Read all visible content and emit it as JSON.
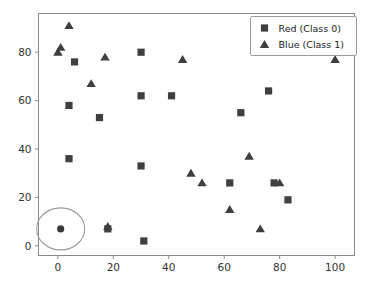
{
  "chart_data": {
    "type": "scatter",
    "title": "",
    "xlabel": "",
    "ylabel": "",
    "xlim": [
      -7,
      107
    ],
    "ylim": [
      -4,
      96
    ],
    "xticks": [
      0,
      20,
      40,
      60,
      80,
      100
    ],
    "yticks": [
      0,
      20,
      40,
      60,
      80
    ],
    "xtick_labels": [
      "0",
      "20",
      "40",
      "60",
      "80",
      "100"
    ],
    "ytick_labels": [
      "0",
      "20",
      "40",
      "60",
      "80"
    ],
    "grid": false,
    "legend_position": "upper right",
    "marker_color": "#3f3f3f",
    "highlight_color": "#9a9a9a",
    "frame_color": "#8a8a8a",
    "background": "#ffffff",
    "series": [
      {
        "name": "Red (Class 0)",
        "marker": "square",
        "color": "#3f3f3f",
        "points": [
          [
            6,
            76
          ],
          [
            4,
            58
          ],
          [
            15,
            53
          ],
          [
            4,
            36
          ],
          [
            30,
            80
          ],
          [
            30,
            62
          ],
          [
            41,
            62
          ],
          [
            30,
            33
          ],
          [
            31,
            2
          ],
          [
            18,
            7
          ],
          [
            66,
            55
          ],
          [
            76,
            64
          ],
          [
            62,
            26
          ],
          [
            78,
            26
          ],
          [
            83,
            19
          ]
        ]
      },
      {
        "name": "Blue (Class 1)",
        "marker": "triangle",
        "color": "#3f3f3f",
        "points": [
          [
            4,
            91
          ],
          [
            0,
            80
          ],
          [
            1,
            82
          ],
          [
            17,
            78
          ],
          [
            12,
            67
          ],
          [
            45,
            77
          ],
          [
            100,
            77
          ],
          [
            69,
            37
          ],
          [
            48,
            30
          ],
          [
            52,
            26
          ],
          [
            80,
            26
          ],
          [
            62,
            15
          ],
          [
            73,
            7
          ],
          [
            18,
            8
          ]
        ]
      }
    ],
    "annotations": [
      {
        "name": "highlighted-point",
        "type": "circled-point",
        "point": [
          1,
          7
        ],
        "ellipse_rx_px": 24,
        "ellipse_ry_px": 21
      }
    ],
    "legend": {
      "entries": [
        {
          "label": "Red (Class 0)",
          "marker": "square"
        },
        {
          "label": "Blue (Class 1)",
          "marker": "triangle"
        }
      ]
    }
  }
}
